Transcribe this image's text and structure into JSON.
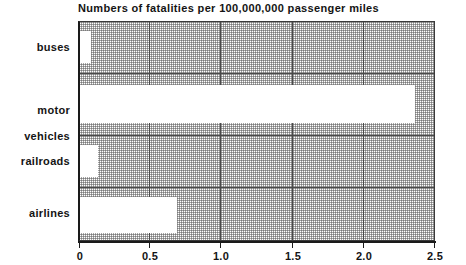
{
  "chart_data": {
    "type": "bar",
    "orientation": "horizontal",
    "title": "Numbers of fatalities per 100,000,000 passenger miles",
    "xlabel": "",
    "ylabel": "",
    "categories": [
      "buses",
      "motor\nvehicles",
      "railroads",
      "airlines"
    ],
    "values": [
      0.08,
      2.36,
      0.13,
      0.68
    ],
    "xlim": [
      0,
      2.5
    ],
    "xticks": [
      0,
      0.5,
      1.0,
      1.5,
      2.0,
      2.5
    ],
    "xtick_labels": [
      "0",
      "0.5",
      "1.0",
      "1.5",
      "2.0",
      "2.5"
    ],
    "grid": true,
    "legend": null,
    "bar_color": "#ffffff",
    "plot_background": "#c8c8c8",
    "axis_color": "#1a1a1a"
  },
  "labels": {
    "cat_0": "buses",
    "cat_1_line1": "motor",
    "cat_1_line2": "vehicles",
    "cat_2": "railroads",
    "cat_3": "airlines"
  },
  "ticks": {
    "t0": "0",
    "t1": "0.5",
    "t2": "1.0",
    "t3": "1.5",
    "t4": "2.0",
    "t5": "2.5"
  }
}
